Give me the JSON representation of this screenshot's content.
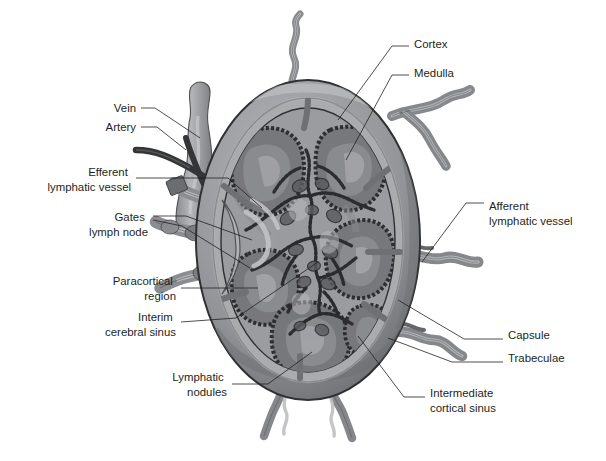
{
  "figure": {
    "type": "anatomical-diagram",
    "background_color": "#ffffff",
    "rendering": "grayscale"
  },
  "palette": {
    "outline": "#231f20",
    "capsule_outer": "#5f6062",
    "capsule_band": "#8f9194",
    "subcapsular_sinus": "#a9abad",
    "cortex_parenchyma": "#9a9c9f",
    "nodule_fill": "#76787b",
    "nodule_center": "#8d8f92",
    "medulla_field": "#b7b9bb",
    "medullary_cord": "#5b5d60",
    "trabecula": "#6e7073",
    "vessel_light": "#9b9da0",
    "vessel_mid": "#7c7e81",
    "artery_dark": "#3a3c3e",
    "highlight": "#c9cbcd"
  },
  "labels": {
    "left": [
      {
        "id": "vein",
        "text": "Vein",
        "x": 136,
        "y": 112,
        "anchor": "end",
        "lines": [
          "Vein"
        ]
      },
      {
        "id": "artery",
        "text": "Artery",
        "x": 136,
        "y": 131,
        "anchor": "end",
        "lines": [
          "Artery"
        ]
      },
      {
        "id": "efferent-lymphatic-vessel",
        "text": "Efferent lymphatic vessel",
        "x": 131,
        "y": 176,
        "anchor": "end",
        "lines": [
          "Efferent",
          "lymphatic vessel"
        ]
      },
      {
        "id": "gates-lymph-node",
        "text": "Gates lymph node",
        "x": 148,
        "y": 221,
        "anchor": "end",
        "lines": [
          "Gates",
          "lymph node"
        ]
      },
      {
        "id": "paracortical-region",
        "text": "Paracortical region",
        "x": 176,
        "y": 285,
        "anchor": "end",
        "lines": [
          "Paracortical",
          "region"
        ]
      },
      {
        "id": "interim-cerebral-sinus",
        "text": "Interim cerebral sinus",
        "x": 176,
        "y": 321,
        "anchor": "end",
        "lines": [
          "Interim",
          "cerebral sinus"
        ]
      },
      {
        "id": "lymphatic-nodules",
        "text": "Lymphatic nodules",
        "x": 227,
        "y": 381,
        "anchor": "end",
        "lines": [
          "Lymphatic",
          "nodules"
        ]
      }
    ],
    "right": [
      {
        "id": "cortex",
        "text": "Cortex",
        "x": 414,
        "y": 48,
        "anchor": "start",
        "lines": [
          "Cortex"
        ]
      },
      {
        "id": "medulla",
        "text": "Medulla",
        "x": 414,
        "y": 77,
        "anchor": "start",
        "lines": [
          "Medulla"
        ]
      },
      {
        "id": "afferent-lymphatic-vessel",
        "text": "Afferent lymphatic vessel",
        "x": 489,
        "y": 210,
        "anchor": "start",
        "lines": [
          "Afferent",
          "lymphatic vessel"
        ]
      },
      {
        "id": "capsule",
        "text": "Capsule",
        "x": 508,
        "y": 339,
        "anchor": "start",
        "lines": [
          "Capsule"
        ]
      },
      {
        "id": "trabeculae",
        "text": "Trabeculae",
        "x": 508,
        "y": 362,
        "anchor": "start",
        "lines": [
          "Trabeculae"
        ]
      },
      {
        "id": "intermediate-cortical-sinus",
        "text": "Intermediate cortical sinus",
        "x": 430,
        "y": 397,
        "anchor": "start",
        "lines": [
          "Intermediate",
          "cortical sinus"
        ]
      }
    ]
  },
  "structures": {
    "node_outline": "oval lymph node, sectioned",
    "lobule_count": 6,
    "afferent_vessel_count": 6,
    "efferent_vessel_count": 3,
    "hilum_side": "left"
  }
}
